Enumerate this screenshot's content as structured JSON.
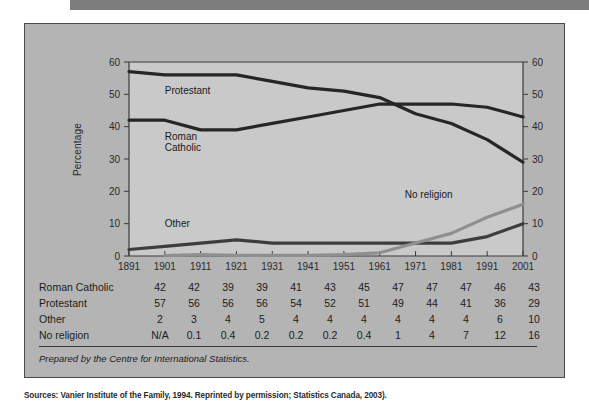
{
  "figure": {
    "caption": "Prepared by the Centre for International Statistics.",
    "source_note": "Sources: Vanier Institute of the Family, 1994. Reprinted by permission; Statistics Canada, 2003)."
  },
  "chart_data": {
    "type": "line",
    "title": "",
    "xlabel": "",
    "ylabel": "Percentage",
    "ylim": [
      0,
      60
    ],
    "yticks": [
      0,
      10,
      20,
      30,
      40,
      50,
      60
    ],
    "grid": false,
    "legend": "inline-labels",
    "right_axis": true,
    "categories": [
      "1891",
      "1901",
      "1911",
      "1921",
      "1931",
      "1941",
      "1951",
      "1961",
      "1971",
      "1981",
      "1991",
      "2001"
    ],
    "series": [
      {
        "name": "Protestant",
        "color": "#262626",
        "values": [
          57,
          56,
          56,
          56,
          54,
          52,
          51,
          49,
          44,
          41,
          36,
          29
        ],
        "label_x": 1901,
        "label_y": 50
      },
      {
        "name": "Roman Catholic",
        "color": "#262626",
        "values": [
          42,
          42,
          39,
          39,
          41,
          43,
          45,
          47,
          47,
          47,
          46,
          43
        ],
        "label_x": 1901,
        "label_y": 36
      },
      {
        "name": "Other",
        "color": "#3d3d3d",
        "values": [
          2,
          3,
          4,
          5,
          4,
          4,
          4,
          4,
          4,
          4,
          6,
          10
        ],
        "label_x": 1901,
        "label_y": 9
      },
      {
        "name": "No religion",
        "color": "#8f8f8f",
        "values": [
          null,
          0.1,
          0.4,
          0.2,
          0.2,
          0.2,
          0.4,
          1,
          4,
          7,
          12,
          16
        ],
        "label_x": 1968,
        "label_y": 18
      }
    ]
  },
  "table": {
    "column_headers": [
      "1891",
      "1901",
      "1911",
      "1921",
      "1931",
      "1941",
      "1951",
      "1961",
      "1971",
      "1981",
      "1991",
      "2001"
    ],
    "rows": [
      {
        "label": "Roman Catholic",
        "values": [
          "42",
          "42",
          "39",
          "39",
          "41",
          "43",
          "45",
          "47",
          "47",
          "47",
          "46",
          "43"
        ]
      },
      {
        "label": "Protestant",
        "values": [
          "57",
          "56",
          "56",
          "56",
          "54",
          "52",
          "51",
          "49",
          "44",
          "41",
          "36",
          "29"
        ]
      },
      {
        "label": "Other",
        "values": [
          "2",
          "3",
          "4",
          "5",
          "4",
          "4",
          "4",
          "4",
          "4",
          "4",
          "6",
          "10"
        ]
      },
      {
        "label": "No religion",
        "values": [
          "N/A",
          "0.1",
          "0.4",
          "0.2",
          "0.2",
          "0.2",
          "0.4",
          "1",
          "4",
          "7",
          "12",
          "16"
        ]
      }
    ]
  }
}
